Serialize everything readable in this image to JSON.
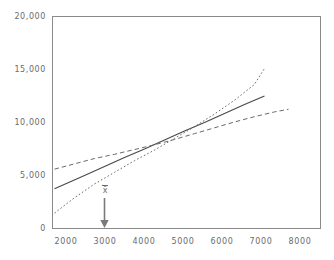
{
  "chart_data": {
    "type": "line",
    "title": "",
    "subtitle": "",
    "xlabel": "",
    "ylabel": "",
    "xlim": [
      1700,
      8400
    ],
    "ylim": [
      0,
      20000
    ],
    "grid": false,
    "legend": null,
    "x_ticks": [
      2000,
      3000,
      4000,
      5000,
      6000,
      7000,
      8000
    ],
    "x_tick_labels": [
      "2000",
      "3000",
      "4000",
      "5000",
      "6000",
      "7000",
      "8000"
    ],
    "y_ticks": [
      0,
      5000,
      10000,
      15000,
      20000
    ],
    "y_tick_labels": [
      "0",
      "5,000",
      "10,000",
      "15,000",
      "20,000"
    ],
    "series": [
      {
        "name": "regression-line",
        "style": "solid",
        "color": "#4a4a4a",
        "x": [
          1750,
          2500,
          3000,
          3500,
          4000,
          4500,
          5000,
          5500,
          6000,
          6500,
          7000
        ],
        "values": [
          3750,
          5000,
          5850,
          6700,
          7500,
          8350,
          9200,
          10000,
          10850,
          11700,
          12500
        ]
      },
      {
        "name": "upper-band",
        "style": "dotted",
        "color": "#6a6a6a",
        "x": [
          1750,
          2250,
          2750,
          3250,
          3750,
          4250,
          4750,
          5250,
          5750,
          6250,
          6750,
          7000
        ],
        "values": [
          1450,
          2900,
          4200,
          5300,
          6400,
          7400,
          8500,
          9600,
          10800,
          12100,
          13600,
          15100
        ]
      },
      {
        "name": "lower-band",
        "style": "dashed",
        "color": "#6a6a6a",
        "x": [
          1750,
          2250,
          2750,
          3250,
          3750,
          4250,
          4750,
          5250,
          5750,
          6250,
          6750,
          7250,
          7600
        ],
        "values": [
          5600,
          6100,
          6600,
          7000,
          7450,
          7900,
          8400,
          8950,
          9500,
          10050,
          10550,
          11000,
          11250
        ]
      }
    ],
    "annotations": [
      {
        "name": "mean-marker",
        "label": "x̄",
        "x": 3000,
        "y": 0,
        "arrow": true,
        "arrow_direction": "down"
      }
    ]
  },
  "axes": {
    "frame_color": "#8a8a8a",
    "tick_color": "#6b6b6b"
  }
}
